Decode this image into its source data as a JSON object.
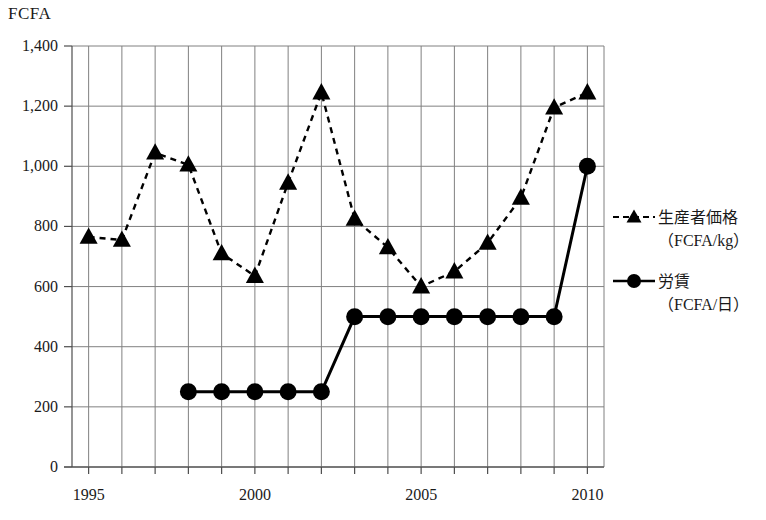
{
  "chart_data": {
    "type": "line",
    "title": "",
    "unit_label": "FCFA",
    "xlabel": "",
    "ylabel": "",
    "x": [
      1995,
      1996,
      1997,
      1998,
      1999,
      2000,
      2001,
      2002,
      2003,
      2004,
      2005,
      2006,
      2007,
      2008,
      2009,
      2010
    ],
    "xlim": [
      1994.5,
      2010.5
    ],
    "ylim": [
      0,
      1400
    ],
    "y_ticks": [
      0,
      200,
      400,
      600,
      800,
      1000,
      1200,
      1400
    ],
    "y_tick_labels": [
      "0",
      "200",
      "400",
      "600",
      "800",
      "1,000",
      "1,200",
      "1,400"
    ],
    "x_ticks": [
      1995,
      1996,
      1997,
      1998,
      1999,
      2000,
      2001,
      2002,
      2003,
      2004,
      2005,
      2006,
      2007,
      2008,
      2009,
      2010
    ],
    "x_tick_labels": [
      "1995",
      "",
      "",
      "",
      "",
      "2000",
      "",
      "",
      "",
      "",
      "2005",
      "",
      "",
      "",
      "",
      "2010"
    ],
    "grid": true,
    "legend_position": "right",
    "series": [
      {
        "name": "生産者価格（FCFA/kg）",
        "label_main": "生産者価格",
        "label_sub": "（FCFA/kg）",
        "marker": "triangle",
        "linestyle": "dashed",
        "color": "#000000",
        "x": [
          1995,
          1996,
          1997,
          1998,
          1999,
          2000,
          2001,
          2002,
          2003,
          2004,
          2005,
          2006,
          2007,
          2008,
          2009,
          2010
        ],
        "values": [
          765,
          755,
          1045,
          1005,
          710,
          635,
          945,
          1245,
          825,
          730,
          600,
          650,
          745,
          895,
          1195,
          1245
        ]
      },
      {
        "name": "労賃（FCFA/日）",
        "label_main": "労賃",
        "label_sub": "（FCFA/日）",
        "marker": "circle",
        "linestyle": "solid",
        "color": "#000000",
        "x": [
          1998,
          1999,
          2000,
          2001,
          2002,
          2003,
          2004,
          2005,
          2006,
          2007,
          2008,
          2009,
          2010
        ],
        "values": [
          250,
          250,
          250,
          250,
          250,
          500,
          500,
          500,
          500,
          500,
          500,
          500,
          1000
        ]
      }
    ]
  },
  "axes": {
    "unit_label": "FCFA"
  },
  "legend": {
    "entries": [
      {
        "main": "生産者価格",
        "sub": "（FCFA/kg）"
      },
      {
        "main": "労賃",
        "sub": "（FCFA/日）"
      }
    ]
  },
  "colors": {
    "ink": "#1a1a1a",
    "grid": "#808080",
    "axis": "#4d4d4d",
    "series": "#000000"
  }
}
